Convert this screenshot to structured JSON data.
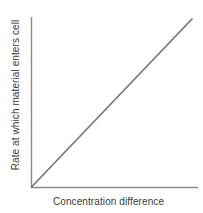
{
  "chart_data": {
    "type": "line",
    "title": "",
    "subtitle": "",
    "xlabel": "Concentration difference",
    "ylabel": "Rate at which material enters cell",
    "xlim": [
      0,
      1
    ],
    "ylim": [
      0,
      1
    ],
    "grid": false,
    "legend": "none",
    "xtick_labels": [],
    "ytick_labels": [],
    "series": [
      {
        "name": "Rate vs concentration difference",
        "x": [
          0,
          0.1,
          0.2,
          0.3,
          0.4,
          0.5,
          0.6,
          0.7,
          0.8,
          0.9,
          1.0
        ],
        "values": [
          0,
          0.1,
          0.2,
          0.3,
          0.4,
          0.5,
          0.6,
          0.7,
          0.8,
          0.9,
          1.0
        ],
        "color": "#7a7a7a",
        "style": "solid-straight-line-through-origin"
      }
    ],
    "annotations": []
  },
  "figure": {
    "background_color": "#ffffff",
    "axis_color": "#8a8a8a",
    "line_color": "#7a7a7a",
    "text_color": "#3b3b3b"
  }
}
